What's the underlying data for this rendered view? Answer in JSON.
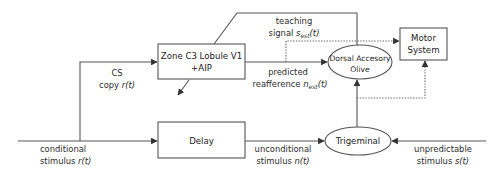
{
  "diagram": {
    "nodes": {
      "zone_c3": {
        "line1": "Zone C3 Lobule V1",
        "line2": "+AIP"
      },
      "delay": {
        "label": "Delay"
      },
      "olive": {
        "line1": "Dorsal Accesory",
        "line2": "Olive"
      },
      "motor": {
        "line1": "Motor",
        "line2": "System"
      },
      "trigeminal": {
        "label": "Trigeminal"
      }
    },
    "edges": {
      "cs_copy": {
        "line1": "CS",
        "line2_prefix": "copy ",
        "line2_var": "r(t)"
      },
      "teaching": {
        "line1": "teaching",
        "line2_prefix": "signal ",
        "var_base": "s",
        "var_sub": "est",
        "var_suffix": "(t)"
      },
      "predicted": {
        "line1": "predicted",
        "line2_prefix": "reafference ",
        "var_base": "n",
        "var_sub": "est",
        "var_suffix": "(t)"
      },
      "conditional": {
        "line1": "conditional",
        "line2_prefix": "stimulus ",
        "line2_var": "r(t)"
      },
      "unconditional": {
        "line1": "unconditional",
        "line2_prefix": "stimulus ",
        "line2_var": "n(t)"
      },
      "unpredictable": {
        "line1": "unpredictable",
        "line2_prefix": "stimulus ",
        "line2_var": "s(t)"
      }
    },
    "colors": {
      "line": "#555555",
      "text": "#222222",
      "background": "#ffffff"
    }
  }
}
